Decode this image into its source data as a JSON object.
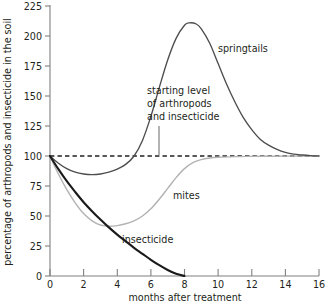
{
  "chart_data": {
    "type": "line",
    "title": "",
    "xlabel": "months after treatment",
    "ylabel": "percentage of arthropods and insecticide in the soil",
    "xlim": [
      0,
      16
    ],
    "ylim": [
      0,
      225
    ],
    "xticks": [
      0,
      2,
      4,
      6,
      8,
      10,
      12,
      14,
      16
    ],
    "xtick_labels": [
      "0",
      "2",
      "4",
      "6",
      "8",
      "10",
      "12",
      "14",
      "16"
    ],
    "yticks": [
      0,
      25,
      50,
      75,
      100,
      125,
      150,
      175,
      200,
      225
    ],
    "ytick_labels": [
      "0",
      "25",
      "50",
      "75",
      "100",
      "125",
      "150",
      "175",
      "200",
      "225"
    ],
    "grid": false,
    "legend_position": "inline-annotations",
    "series": [
      {
        "name": "springtails",
        "label": "springtails",
        "color": "#4d4d4d",
        "x": [
          0,
          0.5,
          1,
          1.5,
          2,
          2.5,
          3,
          3.5,
          4,
          4.5,
          5,
          5.5,
          6,
          6.5,
          7,
          7.5,
          8,
          8.3,
          8.7,
          9,
          9.5,
          10,
          10.5,
          11,
          11.5,
          12,
          12.5,
          13,
          13.5,
          14,
          14.5,
          15,
          15.5,
          16
        ],
        "y": [
          100,
          94,
          89.5,
          86.5,
          85,
          84.5,
          85,
          86.5,
          89,
          93,
          100,
          113,
          133,
          157,
          180,
          198,
          209,
          211,
          210,
          206,
          194,
          177,
          160,
          145,
          132,
          122,
          114,
          109,
          105.5,
          103,
          101.5,
          100.8,
          100.3,
          100
        ]
      },
      {
        "name": "mites",
        "label": "mites",
        "color": "#b3b3b3",
        "x": [
          0,
          0.5,
          1,
          1.5,
          2,
          2.5,
          3,
          3.5,
          4,
          4.5,
          5,
          5.5,
          6,
          6.5,
          7,
          7.5,
          8,
          8.5,
          9,
          9.5,
          10,
          11,
          12,
          13,
          14,
          15,
          16
        ],
        "y": [
          100,
          85,
          72,
          61,
          52,
          46,
          42.5,
          41.5,
          42,
          43.5,
          46,
          50,
          56,
          64,
          73,
          82,
          89.5,
          94.5,
          97,
          98.3,
          99,
          99.5,
          99.7,
          99.8,
          99.9,
          100,
          100
        ]
      },
      {
        "name": "insecticide",
        "label": "insecticide",
        "color": "#1a1a1a",
        "x": [
          0,
          0.5,
          1,
          1.5,
          2,
          2.5,
          3,
          3.5,
          4,
          4.5,
          5,
          5.5,
          6,
          6.5,
          7,
          7.5,
          8
        ],
        "y": [
          100,
          89,
          79,
          70,
          61.5,
          54,
          47,
          40.5,
          34.5,
          29,
          23.5,
          18.5,
          13.5,
          9,
          5,
          1.8,
          0
        ]
      }
    ],
    "reference_line": {
      "name": "starting level of arthropods and insecticide",
      "value": 100,
      "style": "dashed",
      "color": "#231f20"
    },
    "annotations": [
      {
        "name": "starting-level-annotation",
        "lines": [
          "starting level",
          "of arthropods",
          "and insecticide"
        ],
        "points_to_value": 100
      }
    ]
  }
}
